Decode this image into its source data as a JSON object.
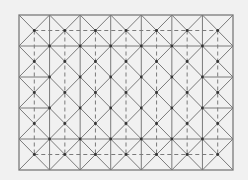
{
  "diagram": {
    "type": "crease-pattern",
    "background": "#f1f1f1",
    "line_color": "#7a7a7a",
    "node_color": "#333333",
    "frame": {
      "x0": 19,
      "y0": 15,
      "x1": 233,
      "y1": 170
    },
    "columns": 7,
    "rows": 5,
    "solid_full_horizontal_rows": [
      1,
      4
    ],
    "solid_edge_horizontal_rows": [
      2,
      3
    ],
    "dashed_horizontal_y_fraction": [
      0.5,
      4.5
    ],
    "dashed_vertical_col_midpoints": true,
    "diagonals": "x-in-every-cell"
  }
}
